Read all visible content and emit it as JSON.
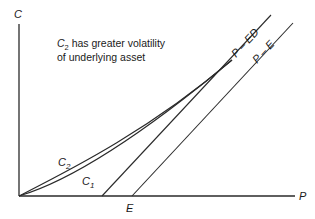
{
  "diagram": {
    "axes": {
      "y_label": "C",
      "x_label": "P",
      "x_tick_label": "E"
    },
    "annotation": {
      "line1_var": "C",
      "line1_sub": "2",
      "line1_rest": " has greater volatility",
      "line2": "of underlying asset"
    },
    "lines": {
      "p_minus_ed": "P – ED",
      "p_minus_e": "P – E"
    },
    "curves": {
      "c2_var": "C",
      "c2_sub": "2",
      "c1_var": "C",
      "c1_sub": "1"
    },
    "colors": {
      "stroke": "#2a2a2a",
      "background": "#ffffff"
    }
  }
}
